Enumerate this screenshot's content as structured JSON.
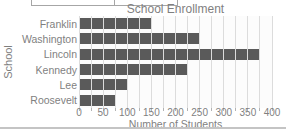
{
  "chart_data": {
    "type": "bar",
    "orientation": "horizontal",
    "title": "School Enrollment",
    "xlabel": "Number of Students",
    "ylabel": "School",
    "categories": [
      "Franklin",
      "Washington",
      "Lincoln",
      "Kennedy",
      "Lee",
      "Roosevelt"
    ],
    "values": [
      150,
      250,
      375,
      225,
      100,
      75
    ],
    "xlim": [
      0,
      400
    ],
    "x_ticks": [
      0,
      50,
      100,
      150,
      200,
      250,
      300,
      350,
      400
    ],
    "gridline_interval": 25,
    "grid": true,
    "legend": "none",
    "colors": {
      "bar": "#5a5a5a",
      "gridline": "#dcdcdc",
      "text": "#7f7f7f"
    }
  }
}
